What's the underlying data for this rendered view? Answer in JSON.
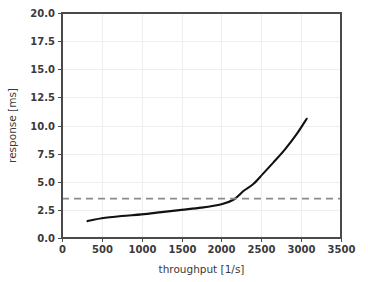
{
  "chart_data": {
    "type": "line",
    "title": "",
    "xlabel": "throughput [1/s]",
    "ylabel": "response [ms]",
    "xlim": [
      0,
      3500
    ],
    "ylim": [
      0.0,
      20.0
    ],
    "grid": true,
    "legend_position": "none",
    "xticks": [
      0,
      500,
      1000,
      1500,
      2000,
      2500,
      3000,
      3500
    ],
    "xtick_labels": [
      "0",
      "500",
      "1000",
      "1500",
      "2000",
      "2500",
      "3000",
      "3500"
    ],
    "yticks": [
      0.0,
      2.5,
      5.0,
      7.5,
      10.0,
      12.5,
      15.0,
      17.5,
      20.0
    ],
    "ytick_labels": [
      "0.0",
      "2.5",
      "5.0",
      "7.5",
      "10.0",
      "12.5",
      "15.0",
      "17.5",
      "20.0"
    ],
    "series": [
      {
        "name": "response",
        "style": "solid",
        "color": "#111111",
        "x": [
          320,
          500,
          750,
          1000,
          1250,
          1500,
          1750,
          2000,
          2150,
          2280,
          2400,
          2520,
          2650,
          2800,
          2950,
          3070
        ],
        "values": [
          1.5,
          1.75,
          1.95,
          2.1,
          2.3,
          2.5,
          2.7,
          3.0,
          3.4,
          4.2,
          4.8,
          5.7,
          6.7,
          7.9,
          9.3,
          10.6
        ]
      },
      {
        "name": "threshold",
        "style": "dashed",
        "color": "#8c8c8c",
        "x": [
          0,
          3500
        ],
        "values": [
          3.5,
          3.5
        ]
      }
    ]
  },
  "labels": {
    "xaxis_title": "throughput [1/s]",
    "yaxis_title": "response [ms]"
  }
}
